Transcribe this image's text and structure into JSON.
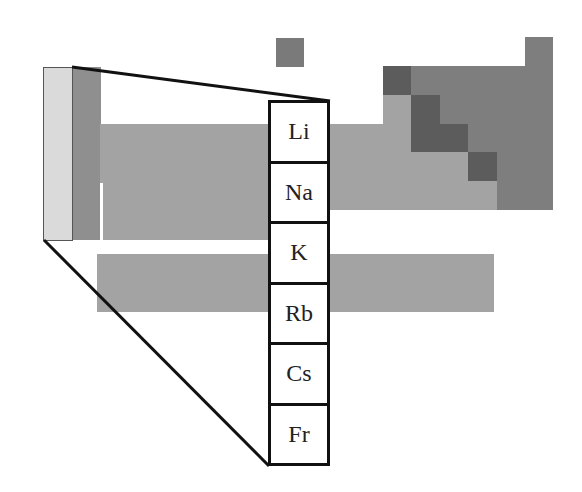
{
  "diagram": {
    "highlighted_group": "Group 1",
    "elements": [
      {
        "symbol": "Li"
      },
      {
        "symbol": "Na"
      },
      {
        "symbol": "K"
      },
      {
        "symbol": "Rb"
      },
      {
        "symbol": "Cs"
      },
      {
        "symbol": "Fr"
      }
    ]
  },
  "colors": {
    "highlight": "#dadada",
    "metal": "#a3a3a3",
    "nonmetal": "#7e7e7e",
    "metalloid": "#5c5c5c",
    "outline": "#111111"
  }
}
